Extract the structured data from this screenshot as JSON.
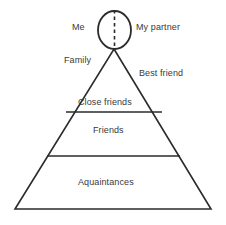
{
  "diagram": {
    "type": "social-circle-pyramid",
    "background_color": "#ffffff",
    "stroke_color": "#2b2b2b",
    "text_color": "#3a3a3a",
    "labels": {
      "me": "Me",
      "my_partner": "My partner",
      "family": "Family",
      "best_friend": "Best friend",
      "close_friends": "Close friends",
      "friends": "Friends",
      "aquaintances": "Aquaintances"
    },
    "shapes": {
      "circle": {
        "name": "couple-circle",
        "center_x": 114.5,
        "center_y": 30,
        "radius_x": 16.5,
        "radius_y": 19,
        "divider": "dashed-vertical"
      },
      "triangle": {
        "name": "pyramid-outline",
        "apex_x": 114,
        "apex_y": 49,
        "left_x": 15,
        "right_x": 211,
        "base_y": 209
      },
      "dividers": [
        {
          "name": "close-friends-divider",
          "y": 112,
          "x1": 66,
          "x2": 162
        },
        {
          "name": "friends-divider",
          "y": 156,
          "x1": 47,
          "x2": 180
        }
      ]
    },
    "tiers": [
      {
        "label": "Close friends",
        "level": 1
      },
      {
        "label": "Friends",
        "level": 2
      },
      {
        "label": "Aquaintances",
        "level": 3
      }
    ]
  }
}
